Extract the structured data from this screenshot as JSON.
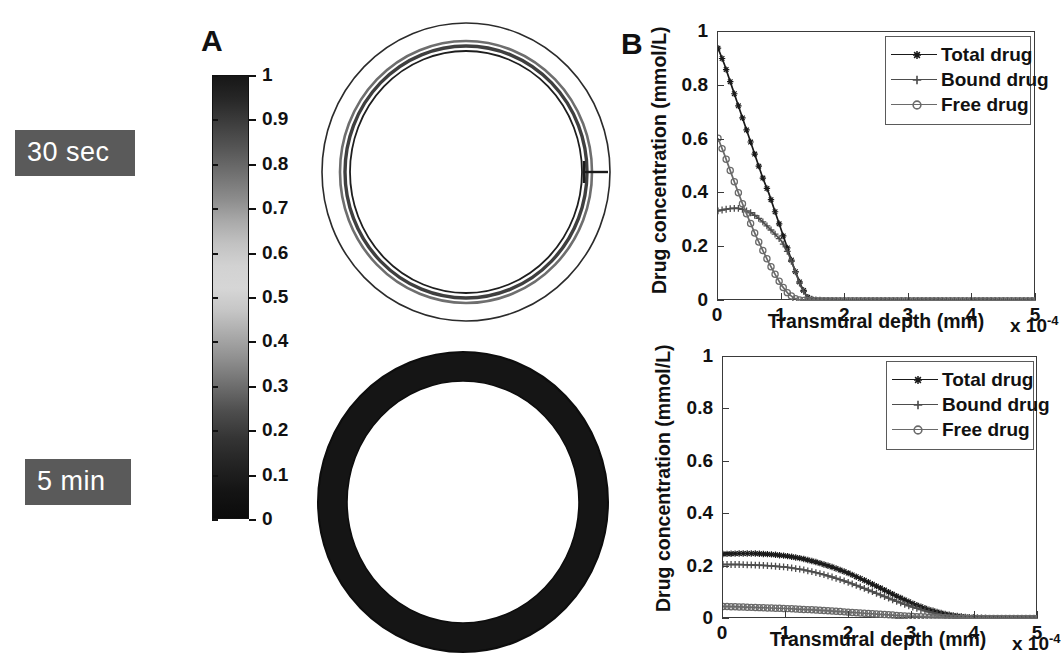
{
  "figure": {
    "panels": [
      {
        "letter": "A",
        "name": "arterial-cross-section-maps"
      },
      {
        "letter": "B",
        "name": "transmural-concentration-profiles"
      }
    ]
  },
  "time_labels": [
    {
      "id": "t30sec",
      "text": "30 sec"
    },
    {
      "id": "t5min",
      "text": "5 min"
    }
  ],
  "colorbar": {
    "min": 0,
    "max": 1,
    "ticks": [
      "1",
      "0.9",
      "0.8",
      "0.7",
      "0.6",
      "0.5",
      "0.4",
      "0.3",
      "0.2",
      "0.1",
      "0"
    ],
    "tick_values": [
      1,
      0.9,
      0.8,
      0.7,
      0.6,
      0.5,
      0.4,
      0.3,
      0.2,
      0.1,
      0
    ],
    "colormap": "grayscale-jet",
    "outline_color": "#111111"
  },
  "rings": [
    {
      "id": "ring-30sec",
      "caption": "30 sec",
      "description": "arterial cross-section with thin dark drug band at the lumen boundary",
      "outer_radius": 145,
      "inner_radius": 112,
      "band_outer_radius": 126,
      "band_inner_radius": 116,
      "band_color": "#4a4a4a",
      "wall_color": "#ffffff",
      "stent_strut": true
    },
    {
      "id": "ring-5min",
      "caption": "5 min",
      "description": "arterial cross-section fully saturated with drug across the wall",
      "outer_radius": 147,
      "inner_radius": 115,
      "band_outer_radius": 147,
      "band_inner_radius": 115,
      "band_color": "#121212",
      "wall_color": "#121212",
      "stent_strut": false
    }
  ],
  "chart_data": [
    {
      "id": "chart-30sec",
      "type": "line",
      "title": "",
      "xlabel": "Transmural depth (mm)",
      "ylabel": "Drug concentration (mmol/L)",
      "x_exponent_label": "x 10",
      "x_exponent_sup": "-4",
      "xlim": [
        0,
        5
      ],
      "ylim": [
        0,
        1
      ],
      "xticks": [
        "0",
        "1",
        "2",
        "3",
        "4",
        "5"
      ],
      "yticks": [
        "0",
        "0.2",
        "0.4",
        "0.6",
        "0.8",
        "1"
      ],
      "xtick_values": [
        0,
        1,
        2,
        3,
        4,
        5
      ],
      "ytick_values": [
        0,
        0.2,
        0.4,
        0.6,
        0.8,
        1
      ],
      "grid": false,
      "legend_position": "top-right",
      "series": [
        {
          "name": "Total drug",
          "marker": "asterisk",
          "color": "#1a1a1a",
          "x": [
            0,
            0.1,
            0.2,
            0.3,
            0.4,
            0.5,
            0.6,
            0.7,
            0.8,
            0.9,
            1.0,
            1.1,
            1.2,
            1.3,
            1.4,
            1.5,
            1.7,
            2.0,
            2.5,
            3.0,
            3.5,
            4.0,
            4.5,
            5.0
          ],
          "values": [
            0.94,
            0.88,
            0.81,
            0.74,
            0.67,
            0.6,
            0.53,
            0.46,
            0.4,
            0.33,
            0.26,
            0.19,
            0.12,
            0.06,
            0.015,
            0.004,
            0.002,
            0.001,
            0.001,
            0.001,
            0.001,
            0.001,
            0.001,
            0.001
          ]
        },
        {
          "name": "Bound drug",
          "marker": "plus",
          "color": "#4d4d4d",
          "x": [
            0,
            0.1,
            0.2,
            0.3,
            0.4,
            0.5,
            0.6,
            0.7,
            0.8,
            0.9,
            1.0,
            1.1,
            1.2,
            1.3,
            1.4,
            1.5,
            1.7,
            2.0,
            2.5,
            3.0,
            3.5,
            4.0,
            4.5,
            5.0
          ],
          "values": [
            0.335,
            0.34,
            0.344,
            0.345,
            0.34,
            0.33,
            0.315,
            0.295,
            0.272,
            0.248,
            0.222,
            0.18,
            0.12,
            0.055,
            0.014,
            0.004,
            0.002,
            0.001,
            0.001,
            0.001,
            0.001,
            0.001,
            0.001,
            0.001
          ]
        },
        {
          "name": "Free drug",
          "marker": "circle",
          "color": "#6a6a6a",
          "x": [
            0,
            0.1,
            0.2,
            0.3,
            0.4,
            0.5,
            0.6,
            0.7,
            0.8,
            0.9,
            1.0,
            1.1,
            1.2,
            1.3,
            1.4,
            1.5,
            1.7,
            2.0,
            2.5,
            3.0,
            3.5,
            4.0,
            4.5,
            5.0
          ],
          "values": [
            0.605,
            0.545,
            0.48,
            0.415,
            0.352,
            0.295,
            0.24,
            0.19,
            0.142,
            0.098,
            0.058,
            0.028,
            0.01,
            0.003,
            0.001,
            0.001,
            0.001,
            0.001,
            0.001,
            0.001,
            0.001,
            0.001,
            0.001,
            0.001
          ]
        }
      ]
    },
    {
      "id": "chart-5min",
      "type": "line",
      "title": "",
      "xlabel": "Transmural depth (mm)",
      "ylabel": "Drug concentration (mmol/L)",
      "x_exponent_label": "x 10",
      "x_exponent_sup": "-4",
      "xlim": [
        0,
        5
      ],
      "ylim": [
        0,
        1
      ],
      "xticks": [
        "0",
        "1",
        "2",
        "3",
        "4",
        "5"
      ],
      "yticks": [
        "0",
        "0.2",
        "0.4",
        "0.6",
        "0.8",
        "1"
      ],
      "xtick_values": [
        0,
        1,
        2,
        3,
        4,
        5
      ],
      "ytick_values": [
        0,
        0.2,
        0.4,
        0.6,
        0.8,
        1
      ],
      "grid": false,
      "legend_position": "top-right",
      "series": [
        {
          "name": "Total drug",
          "marker": "asterisk",
          "color": "#1a1a1a",
          "x": [
            0,
            0.25,
            0.5,
            0.75,
            1.0,
            1.25,
            1.5,
            1.75,
            2.0,
            2.25,
            2.5,
            2.75,
            3.0,
            3.25,
            3.5,
            3.75,
            4.0,
            4.25,
            4.5,
            4.75,
            5.0
          ],
          "values": [
            0.248,
            0.25,
            0.25,
            0.247,
            0.241,
            0.231,
            0.216,
            0.197,
            0.174,
            0.147,
            0.118,
            0.088,
            0.06,
            0.037,
            0.02,
            0.01,
            0.005,
            0.003,
            0.002,
            0.002,
            0.002
          ]
        },
        {
          "name": "Bound drug",
          "marker": "plus",
          "color": "#4d4d4d",
          "x": [
            0,
            0.25,
            0.5,
            0.75,
            1.0,
            1.25,
            1.5,
            1.75,
            2.0,
            2.25,
            2.5,
            2.75,
            3.0,
            3.25,
            3.5,
            3.75,
            4.0,
            4.25,
            4.5,
            4.75,
            5.0
          ],
          "values": [
            0.208,
            0.208,
            0.206,
            0.203,
            0.198,
            0.189,
            0.176,
            0.159,
            0.139,
            0.116,
            0.092,
            0.068,
            0.046,
            0.028,
            0.015,
            0.007,
            0.004,
            0.002,
            0.002,
            0.002,
            0.002
          ]
        },
        {
          "name": "Free drug",
          "marker": "circle",
          "color": "#6a6a6a",
          "x": [
            0,
            0.25,
            0.5,
            0.75,
            1.0,
            1.25,
            1.5,
            1.75,
            2.0,
            2.25,
            2.5,
            2.75,
            3.0,
            3.25,
            3.5,
            3.75,
            4.0,
            4.25,
            4.5,
            4.75,
            5.0
          ],
          "values": [
            0.048,
            0.046,
            0.044,
            0.042,
            0.04,
            0.037,
            0.034,
            0.03,
            0.026,
            0.022,
            0.018,
            0.014,
            0.01,
            0.007,
            0.005,
            0.003,
            0.002,
            0.002,
            0.002,
            0.002,
            0.002
          ]
        }
      ]
    }
  ]
}
